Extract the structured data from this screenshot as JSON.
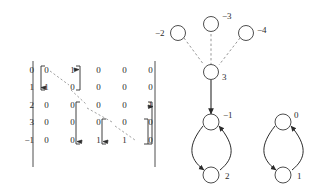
{
  "figure": {
    "kind": "adjacency-matrix-and-graph-diagram",
    "colors": {
      "ink": "#2b2b2b",
      "stroke": "#3a3a3a",
      "dashed": "#8a8a8a",
      "background": "#ffffff"
    }
  },
  "matrix": {
    "row_labels": [
      "0",
      "1",
      "2",
      "3",
      "−1"
    ],
    "rows": [
      [
        "0",
        "1",
        "0",
        "0",
        "0"
      ],
      [
        "1",
        "0",
        "0",
        "0",
        "0"
      ],
      [
        "0",
        "0",
        "0",
        "0",
        "1"
      ],
      [
        "0",
        "0",
        "0",
        "0",
        "0"
      ],
      [
        "0",
        "0",
        "1",
        "1",
        "0"
      ]
    ],
    "blocks": [
      {
        "name": "block-0-1",
        "rows": [
          0,
          1
        ],
        "cols": [
          0,
          1
        ]
      },
      {
        "name": "block-2-3-m1",
        "rows": [
          2,
          3,
          4
        ],
        "cols": [
          2,
          3,
          4
        ]
      },
      {
        "name": "block-3-m1",
        "rows": [
          3,
          4
        ],
        "cols": [
          3,
          4
        ]
      }
    ],
    "bracket_style": "square-brackets",
    "outer_delimiters": [
      "|",
      "|"
    ],
    "annotations": [
      {
        "name": "dashed-diagonal-1",
        "style": "dashed",
        "from_cell": [
          0,
          0
        ],
        "to_cell": [
          1,
          1
        ]
      },
      {
        "name": "dashed-diagonal-2",
        "style": "dashed",
        "from_cell": [
          1,
          1
        ],
        "to_cell": [
          2,
          2
        ]
      },
      {
        "name": "dashed-diagonal-3",
        "style": "dashed",
        "from_cell": [
          2,
          2
        ],
        "to_cell": [
          3,
          3
        ]
      },
      {
        "name": "dashed-diagonal-4",
        "style": "dashed",
        "from_cell": [
          3,
          3
        ],
        "to_cell": [
          4,
          4
        ]
      }
    ]
  },
  "graph": {
    "tree": {
      "root": {
        "id": "3",
        "label": "3",
        "label_side": "right"
      },
      "leaves": [
        {
          "id": "-2",
          "label": "−2",
          "label_side": "left"
        },
        {
          "id": "-3",
          "label": "−3",
          "label_side": "right"
        },
        {
          "id": "-4",
          "label": "−4",
          "label_side": "right"
        }
      ],
      "edge_style": "dashed"
    },
    "trunk": {
      "name": "solid-arrow-down",
      "from": "3",
      "to": "-1",
      "style": "solid-arrow"
    },
    "cycles": [
      {
        "name": "cycle-left",
        "nodes": [
          {
            "id": "-1",
            "label": "−1",
            "label_side": "right",
            "position": "top"
          },
          {
            "id": "2",
            "label": "2",
            "label_side": "right",
            "position": "bottom"
          }
        ],
        "edges": [
          {
            "from": "-1",
            "to": "2",
            "style": "solid-arrow"
          },
          {
            "from": "2",
            "to": "-1",
            "style": "solid-arrow"
          }
        ]
      },
      {
        "name": "cycle-right",
        "nodes": [
          {
            "id": "0",
            "label": "0",
            "label_side": "right",
            "position": "top"
          },
          {
            "id": "1",
            "label": "1",
            "label_side": "right",
            "position": "bottom"
          }
        ],
        "edges": [
          {
            "from": "0",
            "to": "1",
            "style": "solid-arrow"
          },
          {
            "from": "1",
            "to": "0",
            "style": "solid-arrow"
          }
        ]
      }
    ]
  }
}
